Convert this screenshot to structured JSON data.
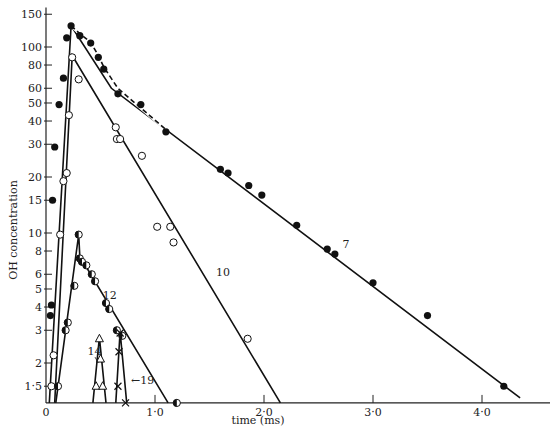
{
  "chart_data": {
    "type": "scatter",
    "title": "",
    "xlabel": "time (ms)",
    "ylabel": "OH concentration",
    "yscale": "log",
    "xlim": [
      0,
      4.6
    ],
    "ylim": [
      1.22,
      155
    ],
    "grid": false,
    "x_ticks": [
      0,
      1.0,
      2.0,
      3.0,
      4.0
    ],
    "x_tick_labels": [
      "0",
      "1·0",
      "2·0",
      "3·0",
      "4·0"
    ],
    "y_ticks": [
      1.5,
      2,
      3,
      4,
      5,
      6,
      8,
      10,
      15,
      20,
      30,
      40,
      50,
      60,
      80,
      100,
      150
    ],
    "y_tick_labels": [
      "1·5",
      "2",
      "3",
      "4",
      "5",
      "6",
      "8",
      "10",
      "15",
      "20",
      "30",
      "40",
      "50",
      "60",
      "80",
      "100",
      "150"
    ],
    "series": [
      {
        "name": "7",
        "marker": "filled-circle",
        "line": "dashed-then-solid",
        "points": [
          [
            0.04,
            3.6
          ],
          [
            0.05,
            4.1
          ],
          [
            0.06,
            15
          ],
          [
            0.08,
            29
          ],
          [
            0.12,
            49
          ],
          [
            0.16,
            68
          ],
          [
            0.19,
            112
          ],
          [
            0.23,
            130
          ],
          [
            0.31,
            115
          ],
          [
            0.41,
            105
          ],
          [
            0.48,
            88
          ],
          [
            0.53,
            76
          ],
          [
            0.66,
            56
          ],
          [
            0.87,
            49
          ],
          [
            1.1,
            35
          ],
          [
            1.6,
            22
          ],
          [
            1.67,
            21
          ],
          [
            1.86,
            18
          ],
          [
            1.98,
            16
          ],
          [
            2.3,
            11
          ],
          [
            2.58,
            8.2
          ],
          [
            2.65,
            7.7
          ],
          [
            3.0,
            5.4
          ],
          [
            3.5,
            3.6
          ],
          [
            4.2,
            1.5
          ]
        ],
        "fit_line": [
          [
            0.03,
            1.22
          ],
          [
            0.23,
            130
          ],
          [
            0.6,
            60
          ],
          [
            4.35,
            1.3
          ]
        ],
        "label_pos": [
          2.72,
          8.3
        ]
      },
      {
        "name": "10",
        "marker": "open-circle",
        "points": [
          [
            0.05,
            1.5
          ],
          [
            0.07,
            2.2
          ],
          [
            0.13,
            9.8
          ],
          [
            0.16,
            19
          ],
          [
            0.19,
            21
          ],
          [
            0.21,
            43
          ],
          [
            0.24,
            88
          ],
          [
            0.3,
            67
          ],
          [
            0.64,
            37
          ],
          [
            0.65,
            32
          ],
          [
            0.68,
            32
          ],
          [
            0.88,
            26
          ],
          [
            1.02,
            10.8
          ],
          [
            1.14,
            10.8
          ],
          [
            1.17,
            8.9
          ],
          [
            1.85,
            2.7
          ]
        ],
        "fit_line": [
          [
            0.08,
            1.22
          ],
          [
            0.24,
            90
          ],
          [
            2.15,
            1.22
          ]
        ],
        "label_pos": [
          1.56,
          5.9
        ]
      },
      {
        "name": "12",
        "marker": "half-filled-circle",
        "points": [
          [
            0.11,
            1.5
          ],
          [
            0.18,
            3.0
          ],
          [
            0.2,
            3.3
          ],
          [
            0.26,
            5.2
          ],
          [
            0.3,
            9.8
          ],
          [
            0.31,
            7.3
          ],
          [
            0.33,
            7.0
          ],
          [
            0.37,
            6.7
          ],
          [
            0.42,
            6.0
          ],
          [
            0.45,
            5.5
          ],
          [
            0.55,
            4.2
          ],
          [
            0.58,
            3.9
          ],
          [
            0.65,
            3.0
          ],
          [
            0.7,
            2.8
          ],
          [
            1.2,
            1.22
          ]
        ],
        "fit_line": [
          [
            0.09,
            1.22
          ],
          [
            0.3,
            9.8
          ],
          [
            0.31,
            7.5
          ],
          [
            1.12,
            1.22
          ]
        ],
        "label_pos": [
          0.52,
          4.4
        ]
      },
      {
        "name": "14",
        "marker": "open-triangle",
        "points": [
          [
            0.46,
            1.5
          ],
          [
            0.49,
            2.7
          ],
          [
            0.5,
            2.1
          ],
          [
            0.52,
            1.5
          ]
        ],
        "fit_line": [
          [
            0.43,
            1.22
          ],
          [
            0.49,
            2.75
          ],
          [
            0.55,
            1.22
          ]
        ],
        "label_pos": [
          0.38,
          2.2
        ]
      },
      {
        "name": "19",
        "marker": "cross",
        "points": [
          [
            0.66,
            1.5
          ],
          [
            0.67,
            2.3
          ],
          [
            0.68,
            2.9
          ],
          [
            0.73,
            1.22
          ]
        ],
        "fit_line": [
          [
            0.64,
            1.22
          ],
          [
            0.68,
            2.95
          ],
          [
            0.74,
            1.22
          ]
        ],
        "label_pos": [
          0.78,
          1.55
        ]
      }
    ]
  },
  "axes": {
    "xlabel": "time (ms)",
    "ylabel": "OH concentration"
  },
  "caption": "Figure: OH concentration versus time for successive flashes"
}
